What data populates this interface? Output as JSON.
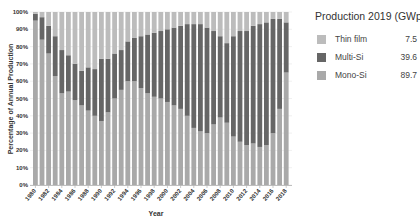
{
  "chart_data": {
    "type": "bar",
    "stacked": true,
    "normalized": true,
    "title": "",
    "xlabel": "Year",
    "ylabel": "Percentage of Annual Production",
    "ylim": [
      0,
      100
    ],
    "yticks": [
      "0%",
      "10%",
      "20%",
      "30%",
      "40%",
      "50%",
      "60%",
      "70%",
      "80%",
      "90%",
      "100%"
    ],
    "xtick_labels": [
      "1980",
      "1982",
      "1984",
      "1986",
      "1988",
      "1990",
      "1992",
      "1994",
      "1996",
      "1998",
      "2000",
      "2002",
      "2004",
      "2006",
      "2008",
      "2010",
      "2012",
      "2014",
      "2016",
      "2018"
    ],
    "grid": true,
    "categories": [
      "1980",
      "1981",
      "1982",
      "1983",
      "1984",
      "1985",
      "1986",
      "1987",
      "1988",
      "1989",
      "1990",
      "1991",
      "1992",
      "1993",
      "1994",
      "1995",
      "1996",
      "1997",
      "1998",
      "1999",
      "2000",
      "2001",
      "2002",
      "2003",
      "2004",
      "2005",
      "2006",
      "2007",
      "2008",
      "2009",
      "2010",
      "2011",
      "2012",
      "2013",
      "2014",
      "2015",
      "2016",
      "2017",
      "2018"
    ],
    "series": [
      {
        "name": "Mono-Si",
        "color": "#a9a9a9",
        "values": [
          95,
          84,
          76,
          63,
          53,
          54,
          49,
          46,
          43,
          40,
          37,
          42,
          50,
          55,
          60,
          60,
          56,
          53,
          51,
          50,
          48,
          46,
          44,
          40,
          33,
          31,
          30,
          35,
          39,
          36,
          28,
          25,
          23,
          24,
          22,
          23,
          30,
          44,
          65
        ]
      },
      {
        "name": "Multi-Si",
        "color": "#666666",
        "values": [
          4,
          13,
          16,
          23,
          25,
          21,
          21,
          20,
          25,
          27,
          36,
          31,
          26,
          23,
          23,
          25,
          30,
          34,
          37,
          39,
          42,
          45,
          48,
          53,
          60,
          62,
          61,
          54,
          47,
          46,
          58,
          64,
          66,
          68,
          71,
          71,
          66,
          52,
          29
        ]
      },
      {
        "name": "Thin film",
        "color": "#bcbcbc",
        "values": [
          1,
          3,
          8,
          14,
          22,
          25,
          30,
          34,
          32,
          33,
          27,
          27,
          24,
          22,
          17,
          15,
          14,
          13,
          12,
          11,
          10,
          9,
          8,
          7,
          7,
          7,
          9,
          11,
          14,
          18,
          14,
          11,
          11,
          8,
          7,
          6,
          4,
          4,
          6
        ]
      }
    ],
    "legend": {
      "title": "Production 2019 (GWp)",
      "position": "right",
      "entries": [
        {
          "label": "Thin film",
          "value": "7.5",
          "color": "#bcbcbc"
        },
        {
          "label": "Multi-Si",
          "value": "39.6",
          "color": "#666666"
        },
        {
          "label": "Mono-Si",
          "value": "89.7",
          "color": "#a9a9a9"
        }
      ]
    }
  }
}
